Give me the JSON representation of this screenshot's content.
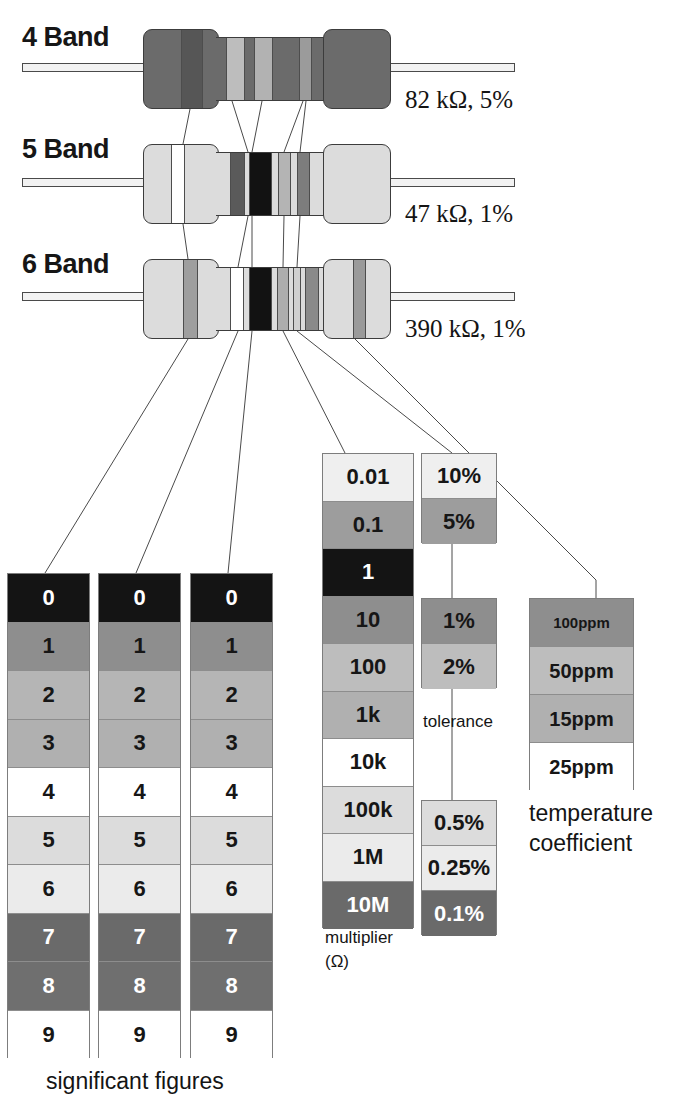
{
  "resistors": [
    {
      "label": "4 Band",
      "value": "82 kΩ, 5%",
      "bands": [
        {
          "name": "band-1-gray-8",
          "color": "#6e6e6e"
        },
        {
          "name": "band-2-red-2",
          "color": "#b9b9b9"
        },
        {
          "name": "band-3-orange-3",
          "color": "#a8a8a8"
        },
        {
          "name": "band-4-gold-5pct",
          "color": "#9b9b9b"
        }
      ],
      "body_color": "#6b6b6b"
    },
    {
      "label": "5 Band",
      "value": "47 kΩ, 1%",
      "bands": [
        {
          "name": "band-1-yellow-4",
          "color": "#ffffff"
        },
        {
          "name": "band-2-violet-7",
          "color": "#5a5a5a"
        },
        {
          "name": "band-3-black-0",
          "color": "#121212"
        },
        {
          "name": "band-4-orange-mult",
          "color": "#b4b4b4"
        },
        {
          "name": "band-5-brown-1pct",
          "color": "#7d7d7d"
        }
      ],
      "body_color": "#dcdcdc"
    },
    {
      "label": "6 Band",
      "value": "390 kΩ, 1%",
      "bands": [
        {
          "name": "band-1-orange-3",
          "color": "#9e9e9e"
        },
        {
          "name": "band-2-white-9",
          "color": "#ffffff"
        },
        {
          "name": "band-3-black-0",
          "color": "#121212"
        },
        {
          "name": "band-4-orange-mult",
          "color": "#adadad"
        },
        {
          "name": "band-5-brown-1pct",
          "color": "#d0d0d0"
        },
        {
          "name": "band-6-tempco",
          "color": "#8a8a8a"
        }
      ],
      "body_color": "#dcdcdc"
    }
  ],
  "tables": {
    "significant_figures": {
      "caption": "significant figures",
      "column_count": 3,
      "rows": [
        {
          "value": "0",
          "color": "#141414",
          "text": "#ffffff"
        },
        {
          "value": "1",
          "color": "#8e8e8e",
          "text": "#161616"
        },
        {
          "value": "2",
          "color": "#b5b5b5",
          "text": "#161616"
        },
        {
          "value": "3",
          "color": "#b0b0b0",
          "text": "#161616"
        },
        {
          "value": "4",
          "color": "#ffffff",
          "text": "#161616"
        },
        {
          "value": "5",
          "color": "#dcdcdc",
          "text": "#161616"
        },
        {
          "value": "6",
          "color": "#ebebeb",
          "text": "#161616"
        },
        {
          "value": "7",
          "color": "#6a6a6a",
          "text": "#ffffff"
        },
        {
          "value": "8",
          "color": "#6f6f6f",
          "text": "#ffffff"
        },
        {
          "value": "9",
          "color": "#ffffff",
          "text": "#161616"
        }
      ]
    },
    "multiplier": {
      "caption_line1": "multiplier",
      "caption_line2": "(Ω)",
      "rows": [
        {
          "value": "0.01",
          "color": "#efefef",
          "text": "#161616"
        },
        {
          "value": "0.1",
          "color": "#9d9d9d",
          "text": "#161616"
        },
        {
          "value": "1",
          "color": "#141414",
          "text": "#ffffff"
        },
        {
          "value": "10",
          "color": "#8e8e8e",
          "text": "#161616"
        },
        {
          "value": "100",
          "color": "#bdbdbd",
          "text": "#161616"
        },
        {
          "value": "1k",
          "color": "#b0b0b0",
          "text": "#161616"
        },
        {
          "value": "10k",
          "color": "#ffffff",
          "text": "#161616"
        },
        {
          "value": "100k",
          "color": "#dcdcdc",
          "text": "#161616"
        },
        {
          "value": "1M",
          "color": "#ebebeb",
          "text": "#161616"
        },
        {
          "value": "10M",
          "color": "#6a6a6a",
          "text": "#ffffff"
        }
      ]
    },
    "tolerance": {
      "caption": "tolerance",
      "groups": [
        {
          "name": "tolerance-group-upper",
          "rows": [
            {
              "value": "10%",
              "color": "#efefef",
              "text": "#161616"
            },
            {
              "value": "5%",
              "color": "#9d9d9d",
              "text": "#161616"
            }
          ]
        },
        {
          "name": "tolerance-group-middle",
          "rows": [
            {
              "value": "1%",
              "color": "#8e8e8e",
              "text": "#161616"
            },
            {
              "value": "2%",
              "color": "#bdbdbd",
              "text": "#161616"
            }
          ]
        },
        {
          "name": "tolerance-group-lower",
          "rows": [
            {
              "value": "0.5%",
              "color": "#dcdcdc",
              "text": "#161616"
            },
            {
              "value": "0.25%",
              "color": "#ebebeb",
              "text": "#161616"
            },
            {
              "value": "0.1%",
              "color": "#6a6a6a",
              "text": "#ffffff"
            }
          ]
        }
      ]
    },
    "temperature_coefficient": {
      "caption_line1": "temperature",
      "caption_line2": "coefficient",
      "rows": [
        {
          "value": "100\nppm",
          "display": "100 ppm",
          "color": "#8e8e8e",
          "text": "#161616",
          "two_line": true
        },
        {
          "value": "50ppm",
          "color": "#bdbdbd",
          "text": "#161616",
          "two_line": false
        },
        {
          "value": "15ppm",
          "color": "#b0b0b0",
          "text": "#161616",
          "two_line": false
        },
        {
          "value": "25ppm",
          "color": "#ffffff",
          "text": "#161616",
          "two_line": false
        }
      ]
    }
  }
}
